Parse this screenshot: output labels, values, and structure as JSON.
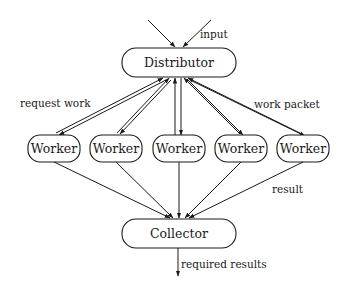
{
  "diagram": {
    "nodes": {
      "distributor": {
        "label": "Distributor"
      },
      "workers": [
        {
          "label": "Worker"
        },
        {
          "label": "Worker"
        },
        {
          "label": "Worker"
        },
        {
          "label": "Worker"
        },
        {
          "label": "Worker"
        }
      ],
      "collector": {
        "label": "Collector"
      }
    },
    "edge_labels": {
      "input": "input",
      "request_work": "request work",
      "work_packet": "work packet",
      "result": "result",
      "required_results": "required results"
    }
  }
}
